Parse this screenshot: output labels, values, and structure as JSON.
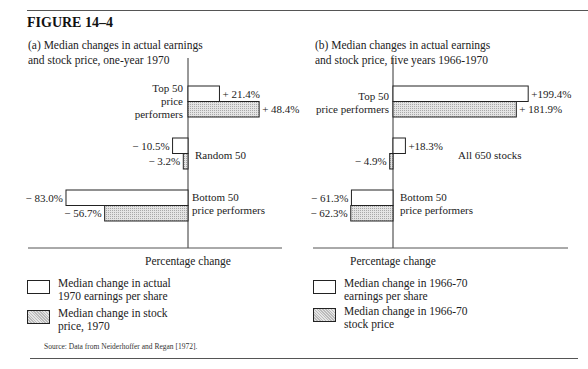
{
  "figure": {
    "title": "FIGURE 14–4",
    "source": "Source: Data from Neiderhoffer and Regan [1972]."
  },
  "chart_data": [
    {
      "type": "bar",
      "orientation": "horizontal",
      "title": "(a) Median changes in actual earnings and stock price, one-year 1970",
      "title_lines": [
        "(a) Median changes in actual earnings",
        "and stock price, one-year 1970"
      ],
      "xlabel": "Percentage change",
      "xlim": [
        -85,
        70
      ],
      "categories": [
        "Top 50 price performers",
        "Random 50",
        "Bottom 50 price performers"
      ],
      "category_label_lines": [
        [
          "Top 50",
          "price",
          "performers"
        ],
        [
          "Random 50"
        ],
        [
          "Bottom 50",
          "price performers"
        ]
      ],
      "series": [
        {
          "name": "Median change in actual 1970 earnings per share",
          "style": "open",
          "values": [
            21.4,
            -10.5,
            -83.0
          ],
          "labels": [
            "+ 21.4%",
            "− 10.5%",
            "− 83.0%"
          ]
        },
        {
          "name": "Median change in stock price, 1970",
          "style": "hatched",
          "values": [
            48.4,
            -3.2,
            -56.7
          ],
          "labels": [
            "+ 48.4%",
            "− 3.2%",
            "− 56.7%"
          ]
        }
      ],
      "legend": [
        {
          "lines": [
            "Median change in actual",
            "1970 earnings per share"
          ],
          "style": "open"
        },
        {
          "lines": [
            "Median change in stock",
            "price, 1970"
          ],
          "style": "hatched"
        }
      ],
      "legend_position": "bottom-left",
      "grid": false
    },
    {
      "type": "bar",
      "orientation": "horizontal",
      "title": "(b) Median changes in actual earnings and stock price, five years 1966-1970",
      "title_lines": [
        "(b) Median changes in actual earnings",
        "and stock price, five years 1966-1970"
      ],
      "xlabel": "Percentage change",
      "xlim": [
        -65,
        255
      ],
      "categories": [
        "Top 50 price performers",
        "All 650 stocks",
        "Bottom 50 price performers"
      ],
      "category_label_lines": [
        [
          "Top 50",
          "price performers"
        ],
        [
          "All 650 stocks"
        ],
        [
          "Bottom 50",
          "price performers"
        ]
      ],
      "series": [
        {
          "name": "Median change in 1966-70 earnings per share",
          "style": "open",
          "values": [
            199.4,
            18.3,
            -61.3
          ],
          "labels": [
            "+199.4%",
            "+18.3%",
            "− 61.3%"
          ]
        },
        {
          "name": "Median change in 1966-70 stock price",
          "style": "hatched",
          "values": [
            181.9,
            -4.9,
            -62.3
          ],
          "labels": [
            "+ 181.9%",
            "− 4.9%",
            "− 62.3%"
          ]
        }
      ],
      "legend": [
        {
          "lines": [
            "Median change in 1966-70",
            "earnings per share"
          ],
          "style": "open"
        },
        {
          "lines": [
            "Median change in 1966-70",
            "stock price"
          ],
          "style": "hatched"
        }
      ],
      "legend_position": "bottom-left",
      "grid": false
    }
  ]
}
